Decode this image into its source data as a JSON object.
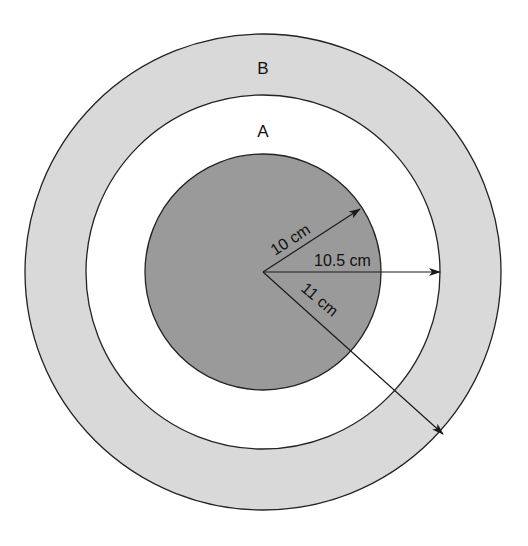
{
  "diagram": {
    "type": "concentric-circles",
    "center": {
      "x": 263,
      "y": 272
    },
    "regions": [
      {
        "id": "outer-ring",
        "label": "B",
        "color": "#d9d9d9",
        "radius_px": 238
      },
      {
        "id": "middle-ring",
        "label": "A",
        "color": "#ffffff",
        "radius_px": 177
      },
      {
        "id": "inner-disk",
        "label": "",
        "color": "#9a9a9a",
        "radius_px": 118
      }
    ],
    "radii": [
      {
        "label": "10 cm",
        "angle_deg": -33,
        "target": "inner-disk"
      },
      {
        "label": "10.5 cm",
        "angle_deg": 0,
        "target": "middle-ring"
      },
      {
        "label": "11 cm",
        "angle_deg": 42,
        "target": "outer-ring"
      }
    ],
    "colors": {
      "stroke": "#222222",
      "outer": "#d9d9d9",
      "middle": "#ffffff",
      "inner": "#9a9a9a"
    }
  }
}
